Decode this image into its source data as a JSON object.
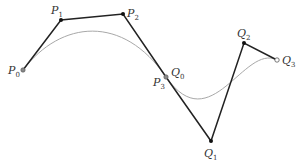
{
  "diagram": {
    "curve_color": "#a0a0a0",
    "polygon_color": "#222222",
    "points": {
      "P0": {
        "x": 23,
        "y": 70,
        "label": "P",
        "sub": "0"
      },
      "P1": {
        "x": 61,
        "y": 20,
        "label": "P",
        "sub": "1"
      },
      "P2": {
        "x": 123,
        "y": 14,
        "label": "P",
        "sub": "2"
      },
      "P3": {
        "x": 166,
        "y": 77,
        "label": "P",
        "sub": "3"
      },
      "Q0": {
        "x": 166,
        "y": 77,
        "label": "Q",
        "sub": "0"
      },
      "Q1": {
        "x": 211,
        "y": 141,
        "label": "Q",
        "sub": "1"
      },
      "Q2": {
        "x": 244,
        "y": 43,
        "label": "Q",
        "sub": "2"
      },
      "Q3": {
        "x": 277,
        "y": 60,
        "label": "Q",
        "sub": "3"
      }
    }
  }
}
